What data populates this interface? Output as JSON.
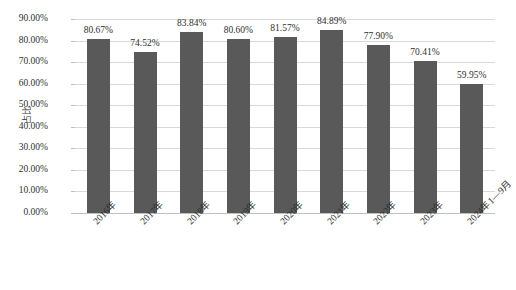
{
  "chart_data": {
    "type": "bar",
    "title": "",
    "xlabel": "",
    "ylabel": "占比",
    "categories": [
      "2016年",
      "2017年",
      "2018年",
      "2019年",
      "2020年",
      "2021年",
      "2022年",
      "2023年",
      "2024年1—9月"
    ],
    "values": [
      80.67,
      74.52,
      83.84,
      80.6,
      81.57,
      84.89,
      77.9,
      70.41,
      59.95
    ],
    "data_labels": [
      "80.67%",
      "74.52%",
      "83.84%",
      "80.60%",
      "81.57%",
      "84.89%",
      "77.90%",
      "70.41%",
      "59.95%"
    ],
    "ylim": [
      0,
      90
    ],
    "ytick_values": [
      0,
      10,
      20,
      30,
      40,
      50,
      60,
      70,
      80,
      90
    ],
    "ytick_labels": [
      "0.00%",
      "10.00%",
      "20.00%",
      "30.00%",
      "40.00%",
      "50.00%",
      "60.00%",
      "70.00%",
      "80.00%",
      "90.00%"
    ],
    "grid": true,
    "legend": "none",
    "series_color": "#595959",
    "gridline_color": "#d9d9d9",
    "axis_color": "#bfbfbf",
    "text_color": "#2f2f2f"
  }
}
